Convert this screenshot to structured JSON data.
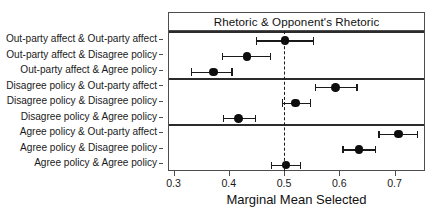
{
  "chart_data": {
    "type": "scatter",
    "title": "Rhetoric & Opponent's Rhetoric",
    "xlabel": "Marginal Mean Selected",
    "ylabel": "",
    "xlim": [
      0.29,
      0.755
    ],
    "xticks": [
      0.3,
      0.4,
      0.5,
      0.6,
      0.7
    ],
    "xticklabels": [
      "0.3",
      "0.4",
      "0.5",
      "0.6",
      "0.7"
    ],
    "grid": false,
    "legend": null,
    "reference_line": {
      "x": 0.5,
      "style": "dashed"
    },
    "error_bars": "horizontal confidence intervals",
    "categories": [
      "Out-party affect & Out-party affect",
      "Out-party affect & Disagree policy",
      "Out-party affect & Agree policy",
      "Disagree policy & Out-party affect",
      "Disagree policy & Disagree policy",
      "Disagree policy & Agree policy",
      "Agree policy & Out-party affect",
      "Agree policy & Disagree policy",
      "Agree policy & Agree policy"
    ],
    "values": [
      0.5,
      0.431,
      0.37,
      0.591,
      0.519,
      0.416,
      0.705,
      0.634,
      0.502
    ],
    "ci_low": [
      0.448,
      0.387,
      0.33,
      0.555,
      0.495,
      0.388,
      0.67,
      0.605,
      0.475
    ],
    "ci_high": [
      0.552,
      0.474,
      0.404,
      0.63,
      0.546,
      0.446,
      0.74,
      0.663,
      0.528
    ],
    "panels": [
      {
        "name": "out-party-affect-panel",
        "rows": [
          0,
          1,
          2
        ]
      },
      {
        "name": "disagree-policy-panel",
        "rows": [
          3,
          4,
          5
        ]
      },
      {
        "name": "agree-policy-panel",
        "rows": [
          6,
          7,
          8
        ]
      }
    ],
    "colors": {
      "point": "#0d0d0d",
      "line": "#1a1a1a",
      "frame": "#4d4d4d"
    }
  }
}
